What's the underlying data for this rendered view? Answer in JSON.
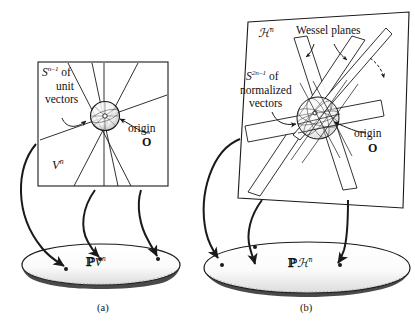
{
  "figure": {
    "type": "mathematical-illustration",
    "background": "#ffffff",
    "ink": "#1a1a1a"
  },
  "panel_a": {
    "caption": "(a)",
    "sphere_label_line1": "S",
    "sphere_label_sup": "n–1",
    "sphere_label_line1_tail": " of",
    "sphere_label_line2": "unit",
    "sphere_label_line3": "vectors",
    "space_label": "V",
    "space_label_sup": "n",
    "origin_label": "origin",
    "origin_symbol": "O",
    "projective_label_p": "ℙ",
    "projective_label_v": "V",
    "projective_label_sup": "n",
    "dot_count": 3,
    "arrow_count": 3,
    "line_count": 5
  },
  "panel_b": {
    "caption": "(b)",
    "space_label": "ℋ",
    "space_label_sup": "n",
    "wessel_label": "Wessel planes",
    "sphere_label_line1": "S",
    "sphere_label_sup": "2n–1",
    "sphere_label_line1_tail": " of",
    "sphere_label_line2": "normalized",
    "sphere_label_line3": "vectors",
    "origin_label": "origin",
    "origin_symbol": "O",
    "projective_label_p": "ℙ",
    "projective_label_h": "ℋ",
    "projective_label_sup": "n",
    "dot_count": 3,
    "arrow_count": 3,
    "plane_count": 4
  },
  "colors": {
    "ink": "#1a1a1a",
    "shade": "#b9b9b9",
    "light_shade": "#d8d8d8",
    "paper": "#ffffff"
  }
}
